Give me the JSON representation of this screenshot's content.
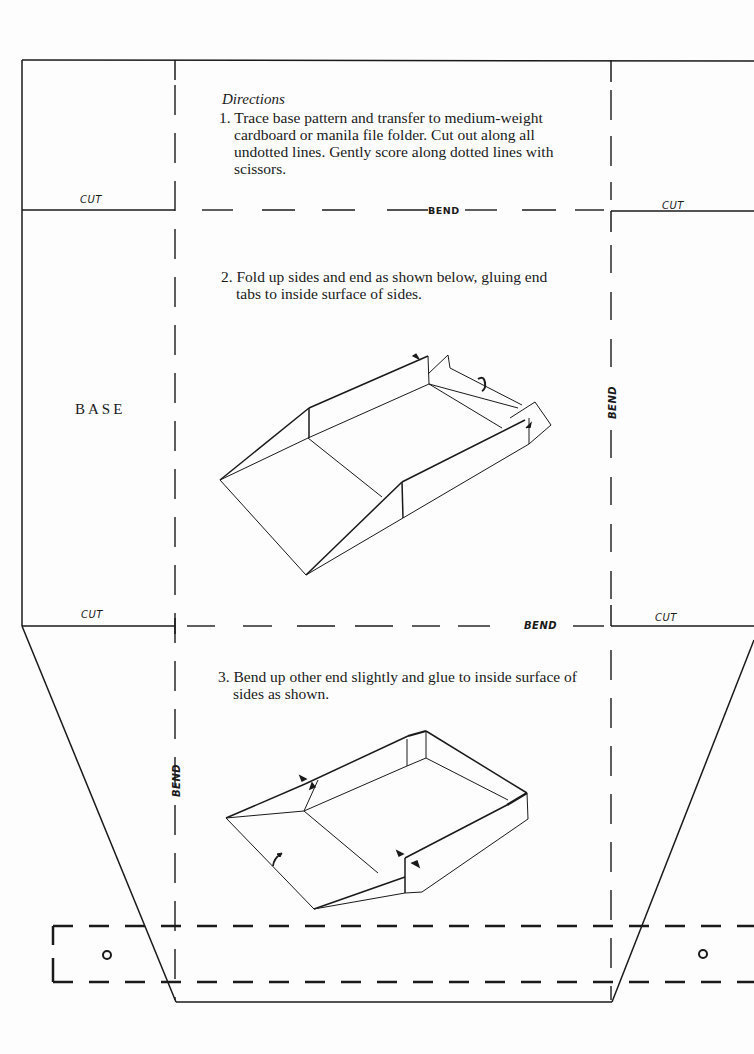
{
  "directions": {
    "heading": "Directions",
    "steps": [
      {
        "number": "1.",
        "text": "Trace base pattern and transfer to medium-weight cardboard or manila file folder. Cut out along all undotted lines. Gently score along dotted lines with scissors."
      },
      {
        "number": "2.",
        "text": "Fold up sides and end as shown below, gluing end tabs to inside surface of sides."
      },
      {
        "number": "3.",
        "text": "Bend up other end slightly and glue to inside surface of sides as shown."
      }
    ]
  },
  "labels": {
    "base": "BASE",
    "cut_top_left": "CUT",
    "cut_top_right": "CUT",
    "cut_bottom_left": "CUT",
    "cut_bottom_right": "CUT",
    "bend_top": "BEND",
    "bend_middle": "BEND",
    "bend_right_vertical": "BEND",
    "bend_left_vertical": "BEND"
  },
  "line_styles": {
    "cut_line": "solid",
    "bend_line": "dashed",
    "ink_color": "#1a1a1a"
  },
  "illustrations": [
    {
      "id": "step-2-figure",
      "description": "partially folded tray with side walls and end tabs, arrows indicating folds"
    },
    {
      "id": "step-3-figure",
      "description": "completed tray with sloped front end glued to sides, arrows indicating glue points"
    }
  ],
  "strap": {
    "holes": 2
  }
}
